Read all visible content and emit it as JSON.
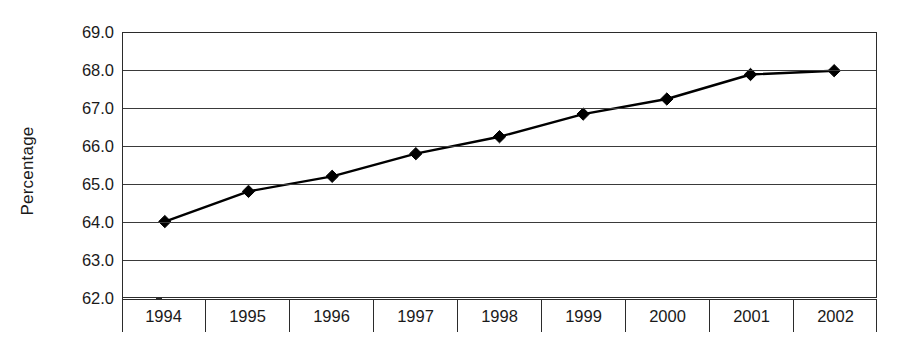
{
  "chart_data": {
    "type": "line",
    "title": "",
    "xlabel": "",
    "ylabel": "Percentage",
    "categories": [
      "1994",
      "1995",
      "1996",
      "1997",
      "1998",
      "1999",
      "2000",
      "2001",
      "2002"
    ],
    "values": [
      64.0,
      64.8,
      65.2,
      65.8,
      66.25,
      66.85,
      67.25,
      67.9,
      68.0
    ],
    "series": [
      {
        "name": "Percentage",
        "values": [
          64.0,
          64.8,
          65.2,
          65.8,
          66.25,
          66.85,
          67.25,
          67.9,
          68.0
        ]
      }
    ],
    "ylim": [
      62.0,
      69.0
    ],
    "ytick_labels": [
      "69.0",
      "68.0",
      "67.0",
      "66.0",
      "65.0",
      "64.0",
      "63.0",
      "62.0"
    ],
    "ytick_values": [
      69.0,
      68.0,
      67.0,
      66.0,
      65.0,
      64.0,
      63.0,
      62.0
    ],
    "grid": true,
    "legend": false,
    "legend_position": "none",
    "marker": "diamond",
    "line_color": "#000000",
    "marker_color": "#000000",
    "grid_color": "#3a3a3a",
    "background_color": "#ffffff"
  },
  "axes": {
    "y_title": "Percentage"
  }
}
